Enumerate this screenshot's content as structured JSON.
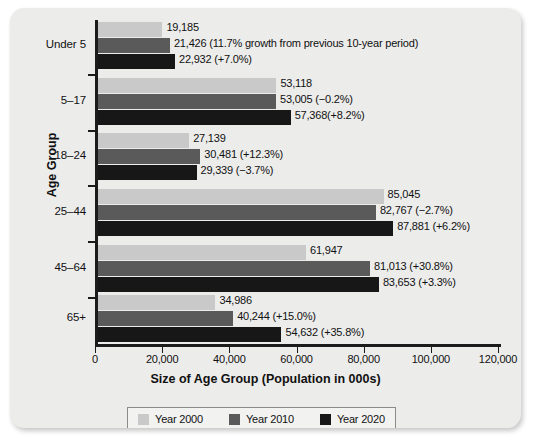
{
  "chart_data": {
    "type": "bar",
    "orientation": "horizontal",
    "title": "",
    "xlabel": "Size of Age Group (Population in 000s)",
    "ylabel": "Age Group",
    "xlim": [
      0,
      120000
    ],
    "xticks": [
      0,
      20000,
      40000,
      60000,
      80000,
      100000,
      120000
    ],
    "xtick_labels": [
      "0",
      "20,000",
      "40,000",
      "60,000",
      "80,000",
      "100,000",
      "120,000"
    ],
    "grid": false,
    "legend_position": "bottom",
    "categories": [
      "Under 5",
      "5–17",
      "18–24",
      "25–44",
      "45–64",
      "65+"
    ],
    "series": [
      {
        "name": "Year 2000",
        "color": "#c9c9c9",
        "values": [
          19185,
          53118,
          27139,
          85045,
          61947,
          34986
        ],
        "labels": [
          "19,185",
          "53,118",
          "27,139",
          "85,045",
          "61,947",
          "34,986"
        ]
      },
      {
        "name": "Year 2010",
        "color": "#5a5a5a",
        "values": [
          21426,
          53005,
          30481,
          82767,
          81013,
          40244
        ],
        "labels": [
          "21,426 (11.7% growth from previous 10-year period)",
          "53,005 (−0.2%)",
          "30,481 (+12.3%)",
          "82,767 (−2.7%)",
          "81,013 (+30.8%)",
          "40,244 (+15.0%)"
        ]
      },
      {
        "name": "Year 2020",
        "color": "#171717",
        "values": [
          22932,
          57368,
          29339,
          87881,
          83653,
          54632
        ],
        "labels": [
          "22,932 (+7.0%)",
          "57,368(+8.2%)",
          "29,339 (−3.7%)",
          "87,881 (+6.2%)",
          "83,653 (+3.3%)",
          "54,632 (+35.8%)"
        ]
      }
    ]
  },
  "legend": {
    "items": [
      {
        "label": "Year 2000",
        "color": "#c9c9c9"
      },
      {
        "label": "Year 2010",
        "color": "#5a5a5a"
      },
      {
        "label": "Year 2020",
        "color": "#171717"
      }
    ]
  }
}
